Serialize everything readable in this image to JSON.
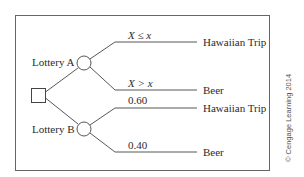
{
  "diagram": {
    "type": "decision-tree",
    "decision_node": {
      "shape": "square"
    },
    "branches": [
      {
        "label": "Lottery A",
        "chance_node": {
          "shape": "circle"
        },
        "outcomes": [
          {
            "condition": "X ≤ x",
            "result": "Hawaiian Trip"
          },
          {
            "condition": "X > x",
            "result": "Beer"
          }
        ]
      },
      {
        "label": "Lottery B",
        "chance_node": {
          "shape": "circle"
        },
        "outcomes": [
          {
            "condition": "0.60",
            "result": "Hawaiian Trip"
          },
          {
            "condition": "0.40",
            "result": "Beer"
          }
        ]
      }
    ],
    "copyright": "© Cengage Learning 2014"
  },
  "colors": {
    "line": "#444444",
    "text": "#2b2b2b",
    "frame": "#666666"
  }
}
